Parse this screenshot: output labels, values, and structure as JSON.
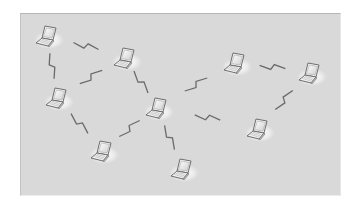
{
  "diagram": {
    "type": "wireless-ad-hoc-network",
    "node_icon": "laptop-icon",
    "link_icon": "lightning-bolt-icon",
    "colors": {
      "background": "#d9d9d9",
      "laptop_body": "#f2f2f2",
      "laptop_outline": "#6e6e6e",
      "screen": "#e8e8e8",
      "link": "#6a6a6a",
      "glow": "#ffffff"
    },
    "nodes": [
      {
        "id": "laptop-1"
      },
      {
        "id": "laptop-2"
      },
      {
        "id": "laptop-3"
      },
      {
        "id": "laptop-4"
      },
      {
        "id": "laptop-5"
      },
      {
        "id": "laptop-6"
      },
      {
        "id": "laptop-7"
      },
      {
        "id": "laptop-8"
      },
      {
        "id": "laptop-9"
      }
    ],
    "links": [
      {
        "from": "laptop-1",
        "to": "laptop-2"
      },
      {
        "from": "laptop-1",
        "to": "laptop-3"
      },
      {
        "from": "laptop-3",
        "to": "laptop-2"
      },
      {
        "from": "laptop-2",
        "to": "laptop-4"
      },
      {
        "from": "laptop-3",
        "to": "laptop-8"
      },
      {
        "from": "laptop-8",
        "to": "laptop-4"
      },
      {
        "from": "laptop-4",
        "to": "laptop-5"
      },
      {
        "from": "laptop-4",
        "to": "laptop-7"
      },
      {
        "from": "laptop-4",
        "to": "laptop-9"
      },
      {
        "from": "laptop-5",
        "to": "laptop-6"
      },
      {
        "from": "laptop-6",
        "to": "laptop-7"
      }
    ]
  }
}
